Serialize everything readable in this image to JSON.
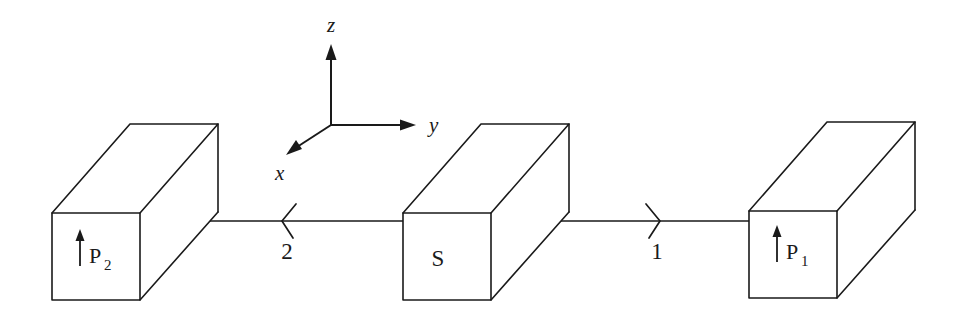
{
  "figure": {
    "name": "epr-source-analyzer-schematic",
    "background_color": "#ffffff",
    "ink_color": "#1a1a1a",
    "width": 960,
    "height": 320
  },
  "axes": {
    "origin_label": "",
    "z_label": "z",
    "y_label": "y",
    "x_label": "x"
  },
  "source": {
    "label": "S",
    "shape": "rectangular-prism"
  },
  "analyzers": [
    {
      "id": "p2",
      "label_base": "P",
      "label_sub": "2",
      "label_full": "P2",
      "orientation_arrow": "up",
      "shape": "rectangular-prism",
      "side": "left"
    },
    {
      "id": "p1",
      "label_base": "P",
      "label_sub": "1",
      "label_full": "P1",
      "orientation_arrow": "up",
      "shape": "rectangular-prism",
      "side": "right"
    }
  ],
  "beams": [
    {
      "id": "beam-2",
      "label": "2",
      "direction": "left",
      "from": "S",
      "to": "P2"
    },
    {
      "id": "beam-1",
      "label": "1",
      "direction": "right",
      "from": "S",
      "to": "P1"
    }
  ]
}
